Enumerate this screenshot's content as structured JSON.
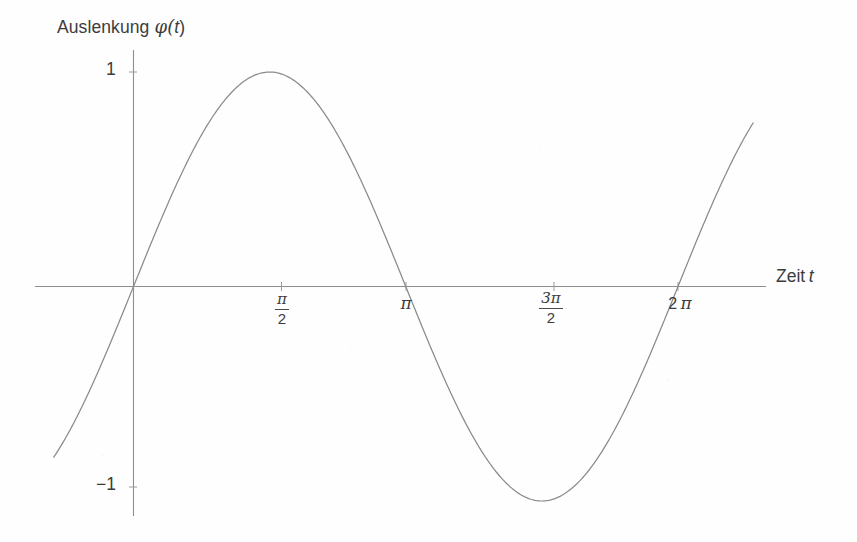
{
  "figure": {
    "background_color": "#fefefe",
    "axis_color": "#8e8e8e",
    "curve_color": "#8a8a8a",
    "text_color": "#3c3c3c"
  },
  "axes": {
    "y_axis_title": "Auslenkung",
    "y_axis_title_symbol": "φ(",
    "y_axis_title_var": "t",
    "y_axis_title_close": ")",
    "x_axis_title": "Zeit",
    "x_axis_title_var": "t",
    "y_ticks": [
      {
        "name": "y-tick-1",
        "label": "1",
        "value": 1
      },
      {
        "name": "y-tick-minus1",
        "label": "−1",
        "value": -1
      }
    ],
    "x_ticks": [
      {
        "name": "x-tick-half-pi",
        "numerator": "π",
        "denominator": "2",
        "value": 1.5708,
        "display": "π/2"
      },
      {
        "name": "x-tick-pi",
        "label": "π",
        "value": 3.1416,
        "display": "π"
      },
      {
        "name": "x-tick-three-half-pi",
        "numerator": "3π",
        "denominator": "2",
        "value": 4.7124,
        "display": "3π/2"
      },
      {
        "name": "x-tick-two-pi",
        "label_prefix": "2",
        "label": "π",
        "value": 6.2832,
        "display": "2π"
      }
    ]
  },
  "chart_data": {
    "type": "line",
    "title": "",
    "xlabel": "Zeit t",
    "ylabel": "Auslenkung φ(t)",
    "xlim": [
      -0.92,
      7.15
    ],
    "ylim": [
      -1.1,
      1.1
    ],
    "grid": false,
    "legend": null,
    "xtick_values": [
      1.5708,
      3.1416,
      4.7124,
      6.2832
    ],
    "xtick_labels": [
      "π/2",
      "π",
      "3π/2",
      "2π"
    ],
    "ytick_values": [
      1,
      -1
    ],
    "ytick_labels": [
      "1",
      "−1"
    ],
    "series": [
      {
        "name": "phi(t) = sin(t)",
        "function": "sin(t)",
        "amplitude": 1,
        "period": 6.2832,
        "phase": 0,
        "x": [
          -0.92,
          -0.7,
          -0.5,
          -0.25,
          0,
          0.25,
          0.5,
          0.7854,
          1.0,
          1.2566,
          1.5708,
          1.8,
          2.0944,
          2.3562,
          2.6,
          2.8274,
          3.1416,
          3.4558,
          3.6652,
          3.927,
          4.1888,
          4.4506,
          4.7124,
          4.9742,
          5.236,
          5.4978,
          5.7596,
          6.0214,
          6.2832,
          6.545,
          6.8068,
          7.15
        ],
        "y": [
          -0.7956,
          -0.6442,
          -0.4794,
          -0.2474,
          0,
          0.2474,
          0.4794,
          0.7071,
          0.8415,
          0.9511,
          1.0,
          0.9738,
          0.866,
          0.7071,
          0.5155,
          0.309,
          0,
          -0.309,
          -0.4955,
          -0.7071,
          -0.866,
          -0.9659,
          -1.0,
          -0.9659,
          -0.866,
          -0.7071,
          -0.5,
          -0.2588,
          0,
          0.2588,
          0.5,
          0.8102
        ],
        "key_points": {
          "maximum": {
            "x": 1.5708,
            "y": 1
          },
          "minimum": {
            "x": 4.7124,
            "y": -1
          },
          "zero_crossings": [
            0,
            3.1416,
            6.2832
          ]
        }
      }
    ]
  }
}
